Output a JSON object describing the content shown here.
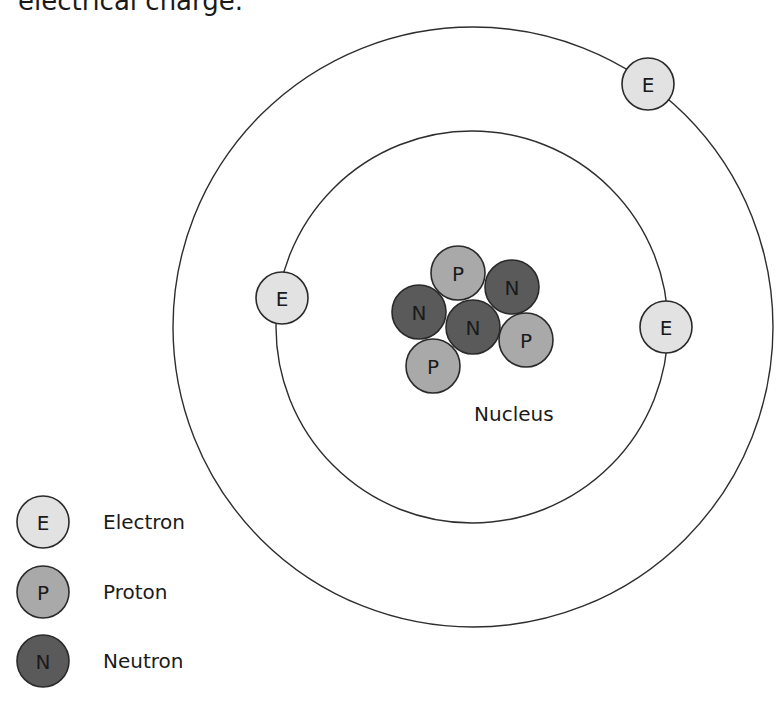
{
  "caption": "electrical charge.",
  "colors": {
    "electron": "#e2e2e2",
    "proton": "#a9a9a9",
    "neutron": "#5a5a5a",
    "orbit": "#2e2e2e",
    "text": "#1a1a1a"
  },
  "orbits": [
    {
      "name": "outer-orbit",
      "cx": 473,
      "cy": 327,
      "r": 300
    },
    {
      "name": "inner-orbit",
      "cx": 472,
      "cy": 327,
      "r": 196
    }
  ],
  "electrons": [
    {
      "letter": "E",
      "cx": 648,
      "cy": 84,
      "r": 26
    },
    {
      "letter": "E",
      "cx": 282,
      "cy": 298,
      "r": 26
    },
    {
      "letter": "E",
      "cx": 666,
      "cy": 327,
      "r": 26
    }
  ],
  "nucleus": {
    "label": "Nucleus",
    "label_x": 474,
    "label_y": 414,
    "particles": [
      {
        "type": "proton",
        "letter": "P",
        "cx": 458,
        "cy": 273,
        "r": 27
      },
      {
        "type": "neutron",
        "letter": "N",
        "cx": 512,
        "cy": 287,
        "r": 27
      },
      {
        "type": "neutron",
        "letter": "N",
        "cx": 419,
        "cy": 312,
        "r": 27
      },
      {
        "type": "neutron",
        "letter": "N",
        "cx": 473,
        "cy": 327,
        "r": 27
      },
      {
        "type": "proton",
        "letter": "P",
        "cx": 526,
        "cy": 340,
        "r": 27
      },
      {
        "type": "proton",
        "letter": "P",
        "cx": 433,
        "cy": 366,
        "r": 27
      }
    ]
  },
  "legend": [
    {
      "type": "electron",
      "letter": "E",
      "label": "Electron",
      "cx": 43,
      "cy": 522
    },
    {
      "type": "proton",
      "letter": "P",
      "label": "Proton",
      "cx": 43,
      "cy": 592
    },
    {
      "type": "neutron",
      "letter": "N",
      "label": "Neutron",
      "cx": 43,
      "cy": 661
    }
  ]
}
